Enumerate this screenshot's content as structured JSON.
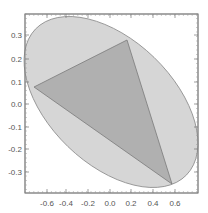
{
  "chart_data": {
    "type": "scatter",
    "title": "",
    "xlabel": "",
    "ylabel": "",
    "xlim": [
      -0.78,
      0.78
    ],
    "ylim": [
      -0.4,
      0.39
    ],
    "grid": false,
    "legend": null,
    "x_ticks": [
      "-0.6",
      "-0.4",
      "-0.2",
      "0.0",
      "0.2",
      "0.4",
      "0.6"
    ],
    "y_ticks": [
      "0.3",
      "0.2",
      "0.1",
      "0.0",
      "-0.1",
      "-0.2",
      "-0.3"
    ],
    "shapes": [
      {
        "name": "ellipse",
        "kind": "filled-ellipse",
        "center": [
          0.02,
          0.01
        ],
        "fill": "#d6d6d6",
        "stroke": "#8a8a8a"
      },
      {
        "name": "inscribed-triangle",
        "kind": "filled-polygon",
        "vertices": [
          [
            0.16,
            0.28
          ],
          [
            -0.68,
            0.07
          ],
          [
            0.57,
            -0.36
          ]
        ],
        "fill": "#a9a9a9",
        "stroke": "#7a7a7a"
      }
    ]
  },
  "axes": {
    "x_ticks": [
      {
        "label": "-0.6",
        "px": 47
      },
      {
        "label": "-0.4",
        "px": 66
      },
      {
        "label": "-0.2",
        "px": 88
      },
      {
        "label": "0.0",
        "px": 110
      },
      {
        "label": "0.2",
        "px": 131
      },
      {
        "label": "0.4",
        "px": 153
      },
      {
        "label": "0.6",
        "px": 175
      }
    ],
    "y_ticks": [
      {
        "label": "0.3",
        "py": 35
      },
      {
        "label": "0.2",
        "py": 59
      },
      {
        "label": "0.1",
        "py": 82
      },
      {
        "label": "0.0",
        "py": 104
      },
      {
        "label": "-0.1",
        "py": 127
      },
      {
        "label": "-0.2",
        "py": 149
      },
      {
        "label": "-0.3",
        "py": 172
      }
    ]
  }
}
